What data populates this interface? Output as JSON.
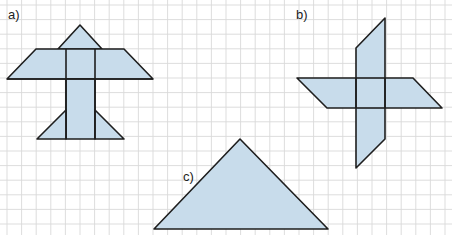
{
  "colors": {
    "background": "#ffffff",
    "grid": "#d9d9d9",
    "fill": "#c8dceb",
    "stroke": "#1e1e1e"
  },
  "grid": {
    "spacing": 14.6,
    "x0": 7,
    "y0": 5
  },
  "figures": [
    {
      "id": "a",
      "label": "a)",
      "label_pos": [
        8,
        19
      ],
      "description": "airplane-like figure composed of triangles, trapezoids and a rectangle",
      "polygons": [
        [
          [
            58,
            49
          ],
          [
            80,
            25
          ],
          [
            102,
            49
          ]
        ],
        [
          [
            36,
            49
          ],
          [
            124,
            49
          ],
          [
            153,
            79
          ],
          [
            7,
            79
          ]
        ],
        [
          [
            66,
            79
          ],
          [
            95,
            79
          ],
          [
            95,
            139
          ],
          [
            66,
            139
          ]
        ],
        [
          [
            66,
            110
          ],
          [
            66,
            139
          ],
          [
            37,
            139
          ]
        ],
        [
          [
            95,
            110
          ],
          [
            124,
            139
          ],
          [
            95,
            139
          ]
        ]
      ],
      "lines": [
        [
          [
            66,
            49
          ],
          [
            66,
            139
          ]
        ],
        [
          [
            95,
            49
          ],
          [
            95,
            139
          ]
        ],
        [
          [
            7,
            79
          ],
          [
            153,
            79
          ]
        ]
      ]
    },
    {
      "id": "b",
      "label": "b)",
      "label_pos": [
        296,
        19
      ],
      "description": "cross made of two overlapping parallelograms",
      "polygons": [
        [
          [
            297,
            78
          ],
          [
            413,
            78
          ],
          [
            442,
            108
          ],
          [
            327,
            108
          ]
        ],
        [
          [
            356,
            48
          ],
          [
            385,
            18
          ],
          [
            385,
            139
          ],
          [
            356,
            168
          ]
        ]
      ],
      "lines": [
        [
          [
            356,
            78
          ],
          [
            356,
            108
          ]
        ],
        [
          [
            385,
            78
          ],
          [
            385,
            108
          ]
        ],
        [
          [
            356,
            78
          ],
          [
            385,
            78
          ]
        ],
        [
          [
            356,
            108
          ],
          [
            385,
            108
          ]
        ]
      ]
    },
    {
      "id": "c",
      "label": "c)",
      "label_pos": [
        183,
        181
      ],
      "description": "isosceles right triangle",
      "polygons": [
        [
          [
            154,
            229
          ],
          [
            240,
            139
          ],
          [
            328,
            229
          ]
        ]
      ],
      "lines": []
    }
  ]
}
